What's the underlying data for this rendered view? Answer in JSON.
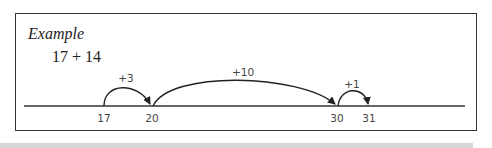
{
  "example": {
    "title": "Example",
    "expression": "17 + 14"
  },
  "number_line": {
    "ticks": [
      {
        "label": "17",
        "x": 104
      },
      {
        "label": "20",
        "x": 152
      },
      {
        "label": "30",
        "x": 337
      },
      {
        "label": "31",
        "x": 369
      }
    ],
    "jumps": [
      {
        "label": "+3",
        "from": "17",
        "to": "20"
      },
      {
        "label": "+10",
        "from": "20",
        "to": "30"
      },
      {
        "label": "+1",
        "from": "30",
        "to": "31"
      }
    ]
  },
  "colors": {
    "line": "#333333",
    "text": "#444444",
    "band": "#d6d6d6"
  }
}
